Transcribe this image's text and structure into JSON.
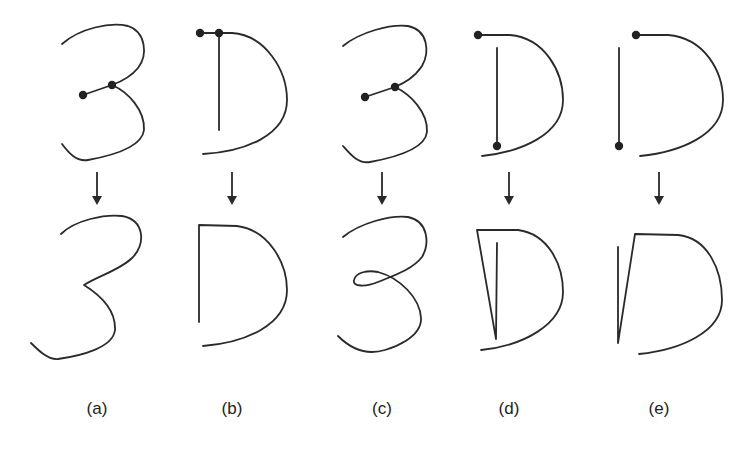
{
  "figure": {
    "panels": [
      {
        "id": "a",
        "label": "(a)",
        "glyph": "3",
        "before": "3 stroke with a short stroke segment joined by two control nodes at the middle cusp",
        "after": "3 with merged middle cusp"
      },
      {
        "id": "b",
        "label": "(b)",
        "glyph": "D",
        "before": "D with two nodes at the top-left connecting vertical stem and bowl",
        "after": "D with stem joined to bowl at top"
      },
      {
        "id": "c",
        "label": "(c)",
        "glyph": "3",
        "before": "3 stroke with a short stroke segment joined by two control nodes at the middle cusp",
        "after": "3 with a small loop at the middle"
      },
      {
        "id": "d",
        "label": "(d)",
        "glyph": "D",
        "before": "D with node at bowl start and node at stem bottom",
        "after": "D with a narrow spike connecting stem bottom to bowl top"
      },
      {
        "id": "e",
        "label": "(e)",
        "glyph": "D",
        "before": "D with node at bowl start and node at stem bottom",
        "after": "D with a narrow spike on the left side"
      }
    ],
    "colors": {
      "stroke": "#2a2a2a",
      "node": "#222222",
      "background": "#ffffff"
    }
  }
}
